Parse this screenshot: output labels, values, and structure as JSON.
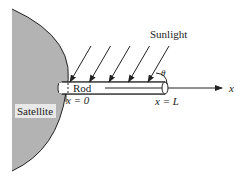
{
  "diagram": {
    "labels": {
      "satellite": "Satellite",
      "rod": "Rod",
      "sunlight": "Sunlight",
      "theta": "θ",
      "x_axis": "x",
      "x_start": "x = 0",
      "x_end": "x = L"
    },
    "sunlight_ray_count": 5,
    "colors": {
      "satellite_fill": "#b3b3b3",
      "line": "#222222",
      "background": "#ffffff"
    }
  }
}
